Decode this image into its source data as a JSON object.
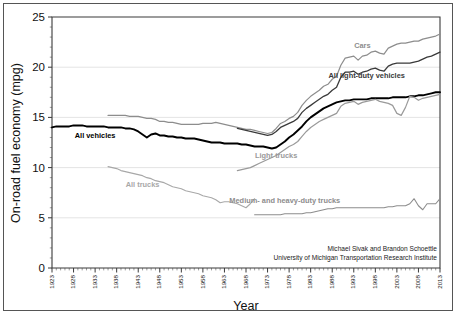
{
  "chart_data": {
    "type": "line",
    "title": "",
    "xlabel": "Year",
    "ylabel": "On-road fuel economy (mpg)",
    "xlim": [
      1923,
      2013
    ],
    "ylim": [
      0,
      25
    ],
    "ytick_values": [
      0,
      5,
      10,
      15,
      20,
      25
    ],
    "ytick_labels": [
      "0",
      "5",
      "10",
      "15",
      "20",
      "25"
    ],
    "xtick_labels": [
      "1923",
      "1928",
      "1933",
      "1938",
      "1943",
      "1948",
      "1953",
      "1958",
      "1963",
      "1968",
      "1973",
      "1978",
      "1983",
      "1988",
      "1993",
      "1998",
      "2003",
      "2008",
      "2013"
    ],
    "xtick_step": 5,
    "x_minor_step": 1,
    "grid": "horizontal-major",
    "legend_position": "inline-annotations",
    "annotations": [
      {
        "text": "Cars",
        "x": 1995,
        "y": 21.9,
        "color": "#8d8d8d"
      },
      {
        "text": "All light-duty vehicles",
        "x": 1996,
        "y": 18.9,
        "color": "#3a3a3a"
      },
      {
        "text": "All vehicles",
        "x": 1933,
        "y": 12.9,
        "color": "#000000"
      },
      {
        "text": "All trucks",
        "x": 1944,
        "y": 8.1,
        "color": "#a8a8a8"
      },
      {
        "text": "Light trucks",
        "x": 1975,
        "y": 11.0,
        "color": "#9a9a9a"
      },
      {
        "text": "Medium- and heavy-duty trucks",
        "x": 1977,
        "y": 6.5,
        "color": "#8d8d8d"
      }
    ],
    "attribution": [
      "Michael Sivak and Brandon Schoettle",
      "University of Michigan Transportation Research Institute"
    ],
    "series": [
      {
        "name": "All vehicles",
        "color": "#000000",
        "width": 1.9,
        "x": [
          1923,
          1924,
          1925,
          1926,
          1927,
          1928,
          1929,
          1930,
          1931,
          1932,
          1933,
          1934,
          1935,
          1936,
          1937,
          1938,
          1939,
          1940,
          1941,
          1942,
          1943,
          1944,
          1945,
          1946,
          1947,
          1948,
          1949,
          1950,
          1951,
          1952,
          1953,
          1954,
          1955,
          1956,
          1957,
          1958,
          1959,
          1960,
          1961,
          1962,
          1963,
          1964,
          1965,
          1966,
          1967,
          1968,
          1969,
          1970,
          1971,
          1972,
          1973,
          1974,
          1975,
          1976,
          1977,
          1978,
          1979,
          1980,
          1981,
          1982,
          1983,
          1984,
          1985,
          1986,
          1987,
          1988,
          1989,
          1990,
          1991,
          1992,
          1993,
          1994,
          1995,
          1996,
          1997,
          1998,
          1999,
          2000,
          2001,
          2002,
          2003,
          2004,
          2005,
          2006,
          2007,
          2008,
          2009,
          2010,
          2011,
          2012,
          2013
        ],
        "y": [
          14.0,
          14.1,
          14.1,
          14.1,
          14.1,
          14.2,
          14.2,
          14.2,
          14.1,
          14.1,
          14.1,
          14.1,
          14.1,
          14.0,
          14.0,
          14.0,
          14.0,
          13.9,
          13.9,
          13.8,
          13.6,
          13.3,
          13.0,
          13.3,
          13.4,
          13.2,
          13.2,
          13.1,
          13.1,
          13.0,
          13.0,
          12.9,
          12.9,
          12.9,
          12.8,
          12.7,
          12.6,
          12.5,
          12.5,
          12.5,
          12.4,
          12.4,
          12.4,
          12.4,
          12.3,
          12.3,
          12.2,
          12.1,
          12.1,
          12.1,
          12.0,
          11.9,
          12.0,
          12.3,
          12.6,
          13.0,
          13.3,
          13.7,
          14.1,
          14.6,
          15.0,
          15.3,
          15.6,
          15.9,
          16.1,
          16.3,
          16.5,
          16.6,
          16.7,
          16.7,
          16.8,
          16.8,
          16.8,
          16.8,
          16.9,
          16.9,
          16.9,
          16.9,
          16.9,
          17.0,
          17.0,
          17.0,
          17.0,
          17.1,
          17.1,
          17.2,
          17.2,
          17.3,
          17.4,
          17.5,
          17.5
        ]
      },
      {
        "name": "Cars",
        "color": "#8d8d8d",
        "width": 1.2,
        "x": [
          1936,
          1937,
          1938,
          1939,
          1940,
          1941,
          1942,
          1943,
          1944,
          1945,
          1946,
          1947,
          1948,
          1949,
          1950,
          1951,
          1952,
          1953,
          1954,
          1955,
          1956,
          1957,
          1958,
          1959,
          1960,
          1961,
          1962,
          1963,
          1964,
          1965,
          1966,
          1967,
          1968,
          1969,
          1970,
          1971,
          1972,
          1973,
          1974,
          1975,
          1976,
          1977,
          1978,
          1979,
          1980,
          1981,
          1982,
          1983,
          1984,
          1985,
          1986,
          1987,
          1988,
          1989,
          1990,
          1991,
          1992,
          1993,
          1994,
          1995,
          1996,
          1997,
          1998,
          1999,
          2000,
          2001,
          2002,
          2003,
          2004,
          2005,
          2006,
          2007,
          2008,
          2009,
          2010,
          2011,
          2012,
          2013
        ],
        "y": [
          15.2,
          15.2,
          15.2,
          15.2,
          15.2,
          15.1,
          15.1,
          15.1,
          15.0,
          14.9,
          14.9,
          14.8,
          14.6,
          14.6,
          14.5,
          14.5,
          14.4,
          14.3,
          14.3,
          14.3,
          14.3,
          14.3,
          14.4,
          14.4,
          14.4,
          14.5,
          14.4,
          14.3,
          14.2,
          14.1,
          14.0,
          13.9,
          13.8,
          13.8,
          13.7,
          13.6,
          13.5,
          13.4,
          13.5,
          13.9,
          14.4,
          14.6,
          14.9,
          15.1,
          15.5,
          16.2,
          16.7,
          17.1,
          17.4,
          17.7,
          18.1,
          18.3,
          18.8,
          19.1,
          20.2,
          20.9,
          21.0,
          21.1,
          20.7,
          21.1,
          21.2,
          21.5,
          21.6,
          21.4,
          21.3,
          21.9,
          22.1,
          22.3,
          22.4,
          22.4,
          22.5,
          22.6,
          22.6,
          22.8,
          22.9,
          23.0,
          23.1,
          23.3
        ]
      },
      {
        "name": "All light-duty vehicles",
        "color": "#3a3a3a",
        "width": 1.3,
        "x": [
          1966,
          1967,
          1968,
          1969,
          1970,
          1971,
          1972,
          1973,
          1974,
          1975,
          1976,
          1977,
          1978,
          1979,
          1980,
          1981,
          1982,
          1983,
          1984,
          1985,
          1986,
          1987,
          1988,
          1989,
          1990,
          1991,
          1992,
          1993,
          1994,
          1995,
          1996,
          1997,
          1998,
          1999,
          2000,
          2001,
          2002,
          2003,
          2004,
          2005,
          2006,
          2007,
          2008,
          2009,
          2010,
          2011,
          2012,
          2013
        ],
        "y": [
          13.9,
          13.8,
          13.7,
          13.6,
          13.5,
          13.4,
          13.3,
          13.2,
          13.3,
          13.6,
          14.0,
          14.2,
          14.4,
          14.6,
          14.9,
          15.5,
          15.9,
          16.2,
          16.5,
          16.8,
          17.1,
          17.3,
          17.7,
          18.0,
          19.0,
          19.5,
          19.5,
          19.6,
          19.3,
          19.5,
          19.6,
          19.8,
          19.9,
          19.7,
          19.6,
          20.1,
          20.3,
          20.4,
          20.4,
          20.4,
          20.4,
          20.5,
          20.6,
          20.8,
          21.0,
          21.1,
          21.3,
          21.5
        ]
      },
      {
        "name": "All trucks",
        "color": "#a8a8a8",
        "width": 1.1,
        "x": [
          1936,
          1937,
          1938,
          1939,
          1940,
          1941,
          1942,
          1943,
          1944,
          1945,
          1946,
          1947,
          1948,
          1949,
          1950,
          1951,
          1952,
          1953,
          1954,
          1955,
          1956,
          1957,
          1958,
          1959,
          1960,
          1961,
          1962,
          1963,
          1964,
          1965,
          1966,
          1967,
          1968,
          1969,
          1970
        ],
        "y": [
          10.1,
          10.0,
          9.9,
          9.7,
          9.6,
          9.5,
          9.4,
          9.3,
          9.2,
          9.0,
          8.9,
          8.7,
          8.6,
          8.5,
          8.3,
          8.1,
          8.0,
          7.9,
          7.7,
          7.6,
          7.5,
          7.4,
          7.2,
          7.1,
          7.0,
          6.8,
          6.5,
          6.6,
          6.6,
          6.5,
          6.4,
          6.2,
          6.0,
          6.4,
          6.9
        ]
      },
      {
        "name": "Light trucks",
        "color": "#9a9a9a",
        "width": 1.2,
        "x": [
          1966,
          1967,
          1968,
          1969,
          1970,
          1971,
          1972,
          1973,
          1974,
          1975,
          1976,
          1977,
          1978,
          1979,
          1980,
          1981,
          1982,
          1983,
          1984,
          1985,
          1986,
          1987,
          1988,
          1989,
          1990,
          1991,
          1992,
          1993,
          1994,
          1995,
          1996,
          1997,
          1998,
          1999,
          2000,
          2001,
          2002,
          2003,
          2004,
          2005,
          2006,
          2007,
          2008,
          2009,
          2010,
          2011,
          2012,
          2013
        ],
        "y": [
          9.7,
          9.8,
          9.9,
          10.0,
          10.2,
          10.4,
          10.6,
          10.8,
          11.0,
          11.2,
          11.5,
          11.8,
          12.1,
          12.3,
          12.6,
          13.1,
          13.6,
          14.0,
          14.3,
          14.6,
          14.8,
          15.0,
          15.2,
          15.4,
          16.1,
          16.4,
          16.5,
          16.6,
          16.3,
          16.5,
          16.6,
          16.7,
          16.8,
          16.6,
          16.5,
          16.4,
          16.2,
          15.4,
          15.2,
          16.0,
          17.1,
          17.0,
          16.7,
          16.9,
          17.0,
          17.1,
          17.2,
          17.3
        ]
      },
      {
        "name": "Medium- and heavy-duty trucks",
        "color": "#8d8d8d",
        "width": 1.1,
        "x": [
          1970,
          1971,
          1972,
          1973,
          1974,
          1975,
          1976,
          1977,
          1978,
          1979,
          1980,
          1981,
          1982,
          1983,
          1984,
          1985,
          1986,
          1987,
          1988,
          1989,
          1990,
          1991,
          1992,
          1993,
          1994,
          1995,
          1996,
          1997,
          1998,
          1999,
          2000,
          2001,
          2002,
          2003,
          2004,
          2005,
          2006,
          2007,
          2008,
          2009,
          2010,
          2011,
          2012,
          2013
        ],
        "y": [
          5.3,
          5.3,
          5.3,
          5.3,
          5.3,
          5.3,
          5.3,
          5.4,
          5.4,
          5.4,
          5.4,
          5.4,
          5.5,
          5.5,
          5.6,
          5.7,
          5.8,
          5.9,
          5.9,
          6.0,
          6.0,
          6.0,
          6.0,
          6.0,
          6.0,
          6.0,
          6.0,
          6.0,
          6.0,
          6.0,
          6.0,
          6.1,
          6.1,
          6.2,
          6.2,
          6.2,
          6.4,
          6.9,
          6.2,
          5.8,
          6.4,
          6.4,
          6.4,
          6.9
        ]
      }
    ]
  }
}
